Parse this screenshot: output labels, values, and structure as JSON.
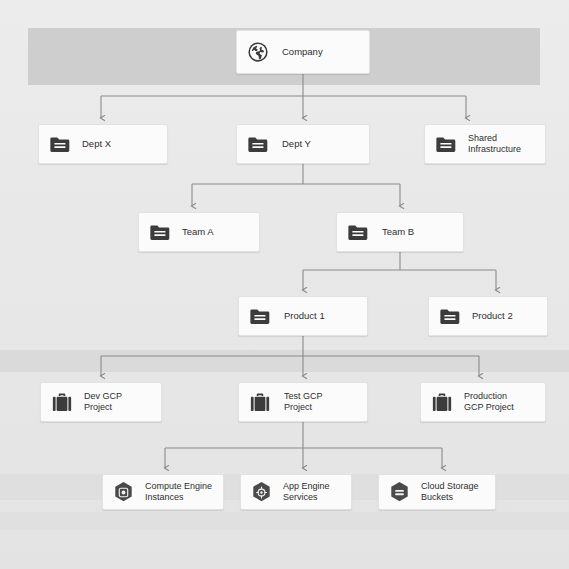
{
  "diagram": {
    "type": "org-hierarchy-tree",
    "background_color": "#e9e9e9",
    "node_color": "#fbfbfb",
    "icon_color": "#3c3c3c",
    "edge_color": "#8a8a8a",
    "levels": [
      {
        "level": 1,
        "name": "organization",
        "nodes": [
          {
            "id": "company",
            "label": "Company",
            "icon": "globe-icon"
          }
        ]
      },
      {
        "level": 2,
        "name": "departments",
        "nodes": [
          {
            "id": "dept-x",
            "label": "Dept X",
            "icon": "folder-icon"
          },
          {
            "id": "dept-y",
            "label": "Dept Y",
            "icon": "folder-icon"
          },
          {
            "id": "shared-infrastructure",
            "label": "Shared\nInfrastructure",
            "icon": "folder-icon"
          }
        ]
      },
      {
        "level": 3,
        "name": "teams",
        "nodes": [
          {
            "id": "team-a",
            "label": "Team A",
            "icon": "folder-icon"
          },
          {
            "id": "team-b",
            "label": "Team B",
            "icon": "folder-icon"
          }
        ]
      },
      {
        "level": 4,
        "name": "products",
        "nodes": [
          {
            "id": "product-1",
            "label": "Product 1",
            "icon": "folder-icon"
          },
          {
            "id": "product-2",
            "label": "Product 2",
            "icon": "folder-icon"
          }
        ]
      },
      {
        "level": 5,
        "name": "projects",
        "nodes": [
          {
            "id": "dev-gcp-project",
            "label": "Dev GCP\nProject",
            "icon": "briefcase-icon"
          },
          {
            "id": "test-gcp-project",
            "label": "Test GCP\nProject",
            "icon": "briefcase-icon"
          },
          {
            "id": "production-gcp-project",
            "label": "Production\nGCP Project",
            "icon": "briefcase-icon"
          }
        ]
      },
      {
        "level": 6,
        "name": "resources",
        "nodes": [
          {
            "id": "compute-engine-instances",
            "label": "Compute Engine\nInstances",
            "icon": "compute-engine-hexagon-icon"
          },
          {
            "id": "app-engine-services",
            "label": "App Engine\nServices",
            "icon": "app-engine-hexagon-icon"
          },
          {
            "id": "cloud-storage-buckets",
            "label": "Cloud Storage\nBuckets",
            "icon": "cloud-storage-hexagon-icon"
          }
        ]
      }
    ],
    "edges": [
      {
        "from": "company",
        "to": "dept-x"
      },
      {
        "from": "company",
        "to": "dept-y"
      },
      {
        "from": "company",
        "to": "shared-infrastructure"
      },
      {
        "from": "dept-y",
        "to": "team-a"
      },
      {
        "from": "dept-y",
        "to": "team-b"
      },
      {
        "from": "team-b",
        "to": "product-1"
      },
      {
        "from": "team-b",
        "to": "product-2"
      },
      {
        "from": "product-1",
        "to": "dev-gcp-project"
      },
      {
        "from": "product-1",
        "to": "test-gcp-project"
      },
      {
        "from": "product-1",
        "to": "production-gcp-project"
      },
      {
        "from": "test-gcp-project",
        "to": "compute-engine-instances"
      },
      {
        "from": "test-gcp-project",
        "to": "app-engine-services"
      },
      {
        "from": "test-gcp-project",
        "to": "cloud-storage-buckets"
      }
    ]
  }
}
